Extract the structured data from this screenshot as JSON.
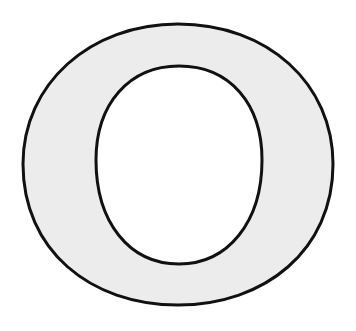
{
  "figure": {
    "fill_color": "#ececec",
    "stroke_color": "#111111",
    "background_color": "#ffffff"
  }
}
